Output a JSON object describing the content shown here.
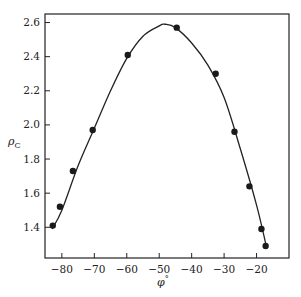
{
  "chart_data": {
    "type": "scatter",
    "title": "",
    "xlabel": "φ°",
    "ylabel": "ρC",
    "xlim": [
      -85.2,
      -10
    ],
    "ylim": [
      1.22,
      2.65
    ],
    "grid": false,
    "legend": null,
    "xticks": [
      -80,
      -70,
      -60,
      -50,
      -40,
      -30,
      -20
    ],
    "xtick_labels": [
      "−80",
      "−70",
      "−60",
      "−50",
      "−40",
      "−30",
      "−20"
    ],
    "yticks": [
      1.4,
      1.6,
      1.8,
      2.0,
      2.2,
      2.4,
      2.6
    ],
    "ytick_labels": [
      "1.4",
      "1.6",
      "1.8",
      "2.0",
      "2.2",
      "2.4",
      "2.6"
    ],
    "series": [
      {
        "name": "measured points",
        "kind": "scatter",
        "x": [
          -82.8,
          -80.6,
          -76.6,
          -70.5,
          -59.7,
          -44.6,
          -32.6,
          -26.8,
          -22.2,
          -18.5,
          -17.2
        ],
        "y": [
          1.41,
          1.52,
          1.73,
          1.97,
          2.41,
          2.57,
          2.3,
          1.96,
          1.64,
          1.39,
          1.29
        ]
      },
      {
        "name": "fitted curve",
        "kind": "line",
        "x": [
          -83,
          -80,
          -75,
          -70,
          -65,
          -60,
          -55,
          -50,
          -48,
          -45,
          -40,
          -35,
          -30,
          -25,
          -20,
          -17
        ],
        "y": [
          1.39,
          1.5,
          1.76,
          1.98,
          2.2,
          2.39,
          2.52,
          2.58,
          2.59,
          2.57,
          2.48,
          2.35,
          2.16,
          1.86,
          1.53,
          1.29
        ]
      }
    ]
  },
  "axes": {
    "x_label_main": "φ",
    "x_label_sup": "°",
    "y_label_main": "ρ",
    "y_label_sub": "C"
  }
}
